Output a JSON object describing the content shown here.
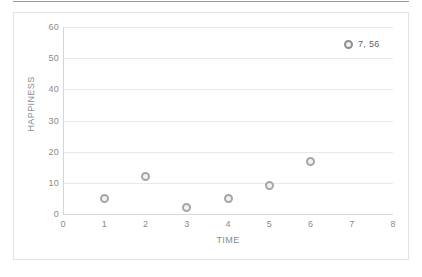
{
  "chart_data": {
    "type": "scatter",
    "title": "",
    "xlabel": "TIME",
    "ylabel": "HAPPINESS",
    "xlim": [
      0,
      8
    ],
    "ylim": [
      0,
      60
    ],
    "xticks": [
      0,
      1,
      2,
      3,
      4,
      5,
      6,
      7,
      8
    ],
    "yticks": [
      0,
      10,
      20,
      30,
      40,
      50,
      60
    ],
    "grid": "horizontal",
    "legend_position": "top-right",
    "series": [
      {
        "name": "7, 56",
        "marker": "ring",
        "color": "#a6a6a6",
        "points": [
          {
            "x": 1,
            "y": 5
          },
          {
            "x": 2,
            "y": 12
          },
          {
            "x": 3,
            "y": 2
          },
          {
            "x": 4,
            "y": 5
          },
          {
            "x": 5,
            "y": 9
          },
          {
            "x": 6,
            "y": 17
          }
        ]
      }
    ],
    "annotations": [
      {
        "name": "legend-entry",
        "text": "7, 56"
      }
    ]
  },
  "legend": {
    "label": "7, 56",
    "marker_icon": "ring-marker-icon"
  },
  "axes": {
    "x_title": "TIME",
    "y_title": "HAPPINESS",
    "x_tick_labels": [
      "0",
      "1",
      "2",
      "3",
      "4",
      "5",
      "6",
      "7",
      "8"
    ],
    "y_tick_labels": [
      "0",
      "10",
      "20",
      "30",
      "40",
      "50",
      "60"
    ]
  },
  "colors": {
    "marker": "#a6a6a6",
    "gridline": "#e9e9e9",
    "axis_line": "#d5d5d5",
    "tick_text": "#8a8a8a",
    "frame": "#e3e3e3",
    "top_rule": "#9a9a9a"
  }
}
